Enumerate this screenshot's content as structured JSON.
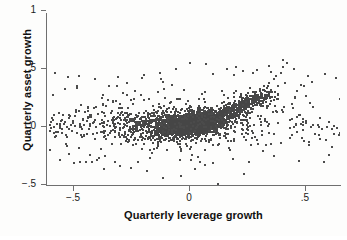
{
  "figure": {
    "background_color": "#fdfdfc",
    "axis_color": "#6f6f6f",
    "marker_color": "#4b4b4b"
  },
  "axes": {
    "x_title": "Quarterly leverage growth",
    "y_title": "Quarterly asset growth",
    "x_ticks": [
      {
        "label": "−.5",
        "value": -0.5
      },
      {
        "label": "0",
        "value": 0
      },
      {
        "label": ".5",
        "value": 0.5
      }
    ],
    "y_ticks": [
      {
        "label": "1",
        "value": 1
      },
      {
        "label": ".5",
        "value": 0.5
      },
      {
        "label": "0",
        "value": 0
      },
      {
        "label": "−.5",
        "value": -0.5
      }
    ]
  },
  "chart_data": {
    "type": "scatter",
    "title": "",
    "subtitle": "",
    "xlabel": "Quarterly leverage growth",
    "ylabel": "Quarterly asset growth",
    "xlim": [
      -0.62,
      0.66
    ],
    "ylim": [
      -0.54,
      1.0
    ],
    "xticks": [
      -0.5,
      0,
      0.5
    ],
    "xticklabels": [
      "−.5",
      "0",
      ".5"
    ],
    "yticks": [
      1,
      0.5,
      0,
      -0.5
    ],
    "yticklabels": [
      "1",
      ".5",
      "0",
      "−.5"
    ],
    "grid": false,
    "legend": null,
    "marker": {
      "shape": "square",
      "size_px": 2,
      "color": "#4b4b4b"
    },
    "spines": [
      "left",
      "bottom"
    ],
    "n_points_approx": 2600,
    "series": [
      {
        "name": "firm-quarters",
        "points": [
          [
            -0.605,
            0.02
          ],
          [
            -0.598,
            -0.01
          ],
          [
            -0.59,
            0.06
          ],
          [
            -0.586,
            0.0
          ],
          [
            -0.58,
            0.47
          ],
          [
            -0.575,
            0.03
          ],
          [
            -0.57,
            -0.04
          ],
          [
            -0.566,
            0.12
          ],
          [
            -0.56,
            0.01
          ],
          [
            -0.556,
            0.05
          ],
          [
            -0.55,
            -0.02
          ],
          [
            -0.546,
            0.1
          ],
          [
            -0.54,
            0.04
          ],
          [
            -0.536,
            -0.07
          ],
          [
            -0.53,
            0.0
          ],
          [
            -0.524,
            0.43
          ],
          [
            -0.52,
            0.08
          ],
          [
            -0.515,
            0.02
          ],
          [
            -0.51,
            -0.03
          ],
          [
            -0.506,
            0.05
          ],
          [
            -0.5,
            -0.31
          ],
          [
            -0.497,
            0.01
          ],
          [
            -0.49,
            0.13
          ],
          [
            -0.486,
            -0.05
          ],
          [
            -0.48,
            0.44
          ],
          [
            -0.476,
            0.03
          ],
          [
            -0.47,
            0.0
          ],
          [
            -0.465,
            -0.09
          ],
          [
            -0.46,
            0.07
          ],
          [
            -0.455,
            0.02
          ],
          [
            -0.45,
            -0.3
          ],
          [
            -0.446,
            0.05
          ],
          [
            -0.44,
            0.17
          ],
          [
            -0.435,
            -0.02
          ],
          [
            -0.43,
            0.01
          ],
          [
            -0.425,
            0.09
          ],
          [
            -0.42,
            -0.06
          ],
          [
            -0.416,
            0.04
          ],
          [
            -0.41,
            0.41
          ],
          [
            -0.405,
            0.0
          ],
          [
            -0.4,
            -0.28
          ],
          [
            -0.396,
            0.11
          ],
          [
            -0.39,
            0.03
          ],
          [
            -0.385,
            -0.04
          ],
          [
            -0.38,
            0.06
          ],
          [
            -0.375,
            0.19
          ],
          [
            -0.37,
            0.0
          ],
          [
            -0.365,
            -0.08
          ],
          [
            -0.36,
            0.02
          ],
          [
            -0.355,
            0.05
          ],
          [
            -0.35,
            0.35
          ],
          [
            -0.346,
            0.01
          ],
          [
            -0.34,
            -0.03
          ],
          [
            -0.335,
            0.14
          ],
          [
            -0.33,
            0.04
          ],
          [
            -0.325,
            -0.3
          ],
          [
            -0.32,
            0.0
          ],
          [
            -0.315,
            0.08
          ],
          [
            -0.31,
            0.43
          ],
          [
            -0.305,
            -0.05
          ],
          [
            -0.3,
            0.03
          ],
          [
            -0.296,
            0.16
          ],
          [
            -0.29,
            -0.01
          ],
          [
            -0.285,
            0.06
          ],
          [
            -0.28,
            0.02
          ],
          [
            -0.276,
            -0.09
          ],
          [
            -0.27,
            0.38
          ],
          [
            -0.265,
            0.1
          ],
          [
            -0.26,
            0.0
          ],
          [
            -0.255,
            -0.04
          ],
          [
            -0.25,
            0.05
          ],
          [
            -0.246,
            0.2
          ],
          [
            -0.24,
            -0.02
          ],
          [
            -0.236,
            0.07
          ],
          [
            -0.23,
            0.01
          ],
          [
            -0.225,
            -0.3
          ],
          [
            -0.22,
            0.12
          ],
          [
            -0.215,
            0.03
          ],
          [
            -0.21,
            -0.06
          ],
          [
            -0.205,
            0.42
          ],
          [
            -0.2,
            0.0
          ],
          [
            -0.196,
            0.09
          ],
          [
            -0.19,
            -0.03
          ],
          [
            -0.186,
            0.05
          ],
          [
            -0.18,
            0.02
          ],
          [
            -0.176,
            0.24
          ],
          [
            -0.17,
            -0.08
          ],
          [
            -0.165,
            0.04
          ],
          [
            -0.16,
            0.0
          ],
          [
            -0.155,
            0.11
          ],
          [
            -0.15,
            -0.04
          ],
          [
            -0.146,
            0.06
          ],
          [
            -0.14,
            0.01
          ],
          [
            -0.136,
            0.3
          ],
          [
            -0.13,
            -0.02
          ],
          [
            -0.126,
            0.08
          ],
          [
            -0.12,
            0.03
          ],
          [
            -0.116,
            -0.06
          ],
          [
            -0.11,
            0.05
          ],
          [
            -0.106,
            0.0
          ],
          [
            -0.1,
            0.13
          ],
          [
            -0.098,
            -0.03
          ],
          [
            -0.095,
            0.04
          ],
          [
            -0.09,
            0.02
          ],
          [
            -0.086,
            -0.05
          ],
          [
            -0.08,
            0.07
          ],
          [
            -0.076,
            0.0
          ],
          [
            -0.07,
            0.09
          ],
          [
            -0.066,
            -0.02
          ],
          [
            -0.06,
            0.04
          ],
          [
            -0.055,
            0.01
          ],
          [
            -0.05,
            -0.04
          ],
          [
            -0.046,
            0.06
          ],
          [
            -0.04,
            0.03
          ],
          [
            -0.036,
            0.0
          ],
          [
            -0.03,
            0.08
          ],
          [
            -0.026,
            -0.03
          ],
          [
            -0.02,
            0.05
          ],
          [
            -0.016,
            0.02
          ],
          [
            -0.01,
            0.01
          ],
          [
            0.0,
            0.03
          ],
          [
            0.005,
            0.0
          ],
          [
            0.01,
            0.06
          ],
          [
            0.015,
            -0.02
          ],
          [
            0.02,
            0.04
          ],
          [
            0.025,
            0.01
          ],
          [
            0.03,
            0.08
          ],
          [
            0.035,
            -0.01
          ],
          [
            0.04,
            0.05
          ],
          [
            0.045,
            0.02
          ],
          [
            0.05,
            0.1
          ],
          [
            0.055,
            0.03
          ],
          [
            0.06,
            0.0
          ],
          [
            0.065,
            0.07
          ],
          [
            0.07,
            0.04
          ],
          [
            0.075,
            0.12
          ],
          [
            0.08,
            0.01
          ],
          [
            0.085,
            0.06
          ],
          [
            0.09,
            0.03
          ],
          [
            0.095,
            0.09
          ],
          [
            0.1,
            0.05
          ],
          [
            0.11,
            0.14
          ],
          [
            0.12,
            0.08
          ],
          [
            0.13,
            0.04
          ],
          [
            0.14,
            0.11
          ],
          [
            0.15,
            0.16
          ],
          [
            0.16,
            0.07
          ],
          [
            0.17,
            0.13
          ],
          [
            0.18,
            0.18
          ],
          [
            0.19,
            0.1
          ],
          [
            0.2,
            0.2
          ],
          [
            0.21,
            0.15
          ],
          [
            0.22,
            0.22
          ],
          [
            0.23,
            0.17
          ],
          [
            0.24,
            0.25
          ],
          [
            0.25,
            0.2
          ],
          [
            0.26,
            0.27
          ],
          [
            0.27,
            0.23
          ],
          [
            0.28,
            0.3
          ],
          [
            0.29,
            0.26
          ],
          [
            0.3,
            0.33
          ],
          [
            0.31,
            0.28
          ],
          [
            0.32,
            0.35
          ],
          [
            0.33,
            0.3
          ],
          [
            0.34,
            0.38
          ],
          [
            0.35,
            0.32
          ],
          [
            0.36,
            0.41
          ],
          [
            0.37,
            0.44
          ],
          [
            0.38,
            0.35
          ],
          [
            0.39,
            0.47
          ],
          [
            0.4,
            0.52
          ],
          [
            0.41,
            0.38
          ],
          [
            0.42,
            0.55
          ],
          [
            0.43,
            0.06
          ],
          [
            0.44,
            0.2
          ],
          [
            0.45,
            0.0
          ],
          [
            0.46,
            -0.04
          ],
          [
            0.47,
            0.1
          ],
          [
            0.48,
            0.03
          ],
          [
            0.49,
            -0.12
          ],
          [
            0.5,
            0.05
          ],
          [
            0.51,
            0.44
          ],
          [
            0.52,
            0.0
          ],
          [
            0.53,
            0.17
          ],
          [
            0.54,
            -0.06
          ],
          [
            0.55,
            0.02
          ],
          [
            0.56,
            0.08
          ],
          [
            0.57,
            -0.02
          ],
          [
            0.58,
            0.46
          ],
          [
            0.59,
            0.0
          ],
          [
            0.6,
            0.04
          ],
          [
            0.61,
            -0.17
          ],
          [
            0.62,
            0.01
          ],
          [
            0.63,
            0.42
          ],
          [
            0.64,
            -0.07
          ],
          [
            0.65,
            0.02
          ],
          [
            0.12,
            -0.49
          ],
          [
            -0.115,
            -0.44
          ],
          [
            -0.04,
            -0.42
          ],
          [
            0.02,
            -0.36
          ],
          [
            -0.185,
            -0.38
          ],
          [
            0.065,
            -0.33
          ],
          [
            0.1,
            -0.31
          ],
          [
            -0.3,
            -0.34
          ],
          [
            -0.255,
            -0.35
          ],
          [
            0.23,
            0.48
          ],
          [
            0.16,
            0.5
          ],
          [
            0.1,
            0.46
          ],
          [
            0.0,
            0.55
          ],
          [
            -0.06,
            0.5
          ],
          [
            0.29,
            0.49
          ],
          [
            0.34,
            0.53
          ],
          [
            0.2,
            0.52
          ],
          [
            -0.13,
            0.47
          ],
          [
            0.07,
            0.54
          ],
          [
            0.4,
            0.58
          ],
          [
            0.19,
            0.45
          ],
          [
            -0.2,
            0.45
          ],
          [
            0.27,
            0.47
          ],
          [
            0.45,
            0.5
          ]
        ]
      }
    ]
  }
}
